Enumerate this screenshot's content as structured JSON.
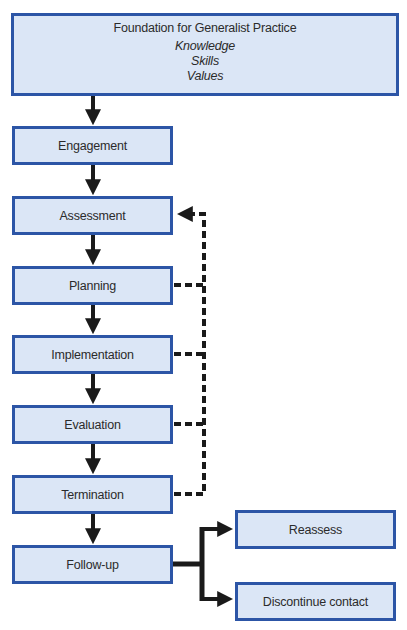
{
  "foundation": {
    "title": "Foundation for Generalist Practice",
    "items": [
      "Knowledge",
      "Skills",
      "Values"
    ]
  },
  "stages": [
    {
      "label": "Engagement",
      "top": 126
    },
    {
      "label": "Assessment",
      "top": 196
    },
    {
      "label": "Planning",
      "top": 266
    },
    {
      "label": "Implementation",
      "top": 335
    },
    {
      "label": "Evaluation",
      "top": 405
    },
    {
      "label": "Termination",
      "top": 475
    },
    {
      "label": "Follow-up",
      "top": 545
    }
  ],
  "outcomes": [
    {
      "label": "Reassess",
      "top": 510
    },
    {
      "label": "Discontinue contact",
      "top": 582
    }
  ],
  "feedback_loop": {
    "target": "Assessment",
    "sources": [
      "Planning",
      "Implementation",
      "Evaluation",
      "Termination"
    ],
    "style": "dashed"
  },
  "colors": {
    "box_fill": "#dbe6f6",
    "box_border": "#2c55a6",
    "arrow": "#1a1a1a"
  }
}
